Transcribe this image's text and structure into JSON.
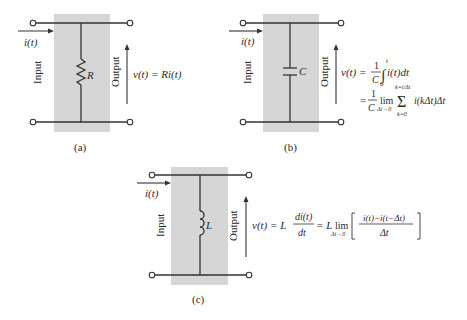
{
  "panels": [
    {
      "id": "a",
      "caption": "(a)",
      "element": "resistor",
      "element_label": "R",
      "current_label": "i(t)",
      "input_label": "Input",
      "output_label": "Output",
      "equation": {
        "lhs": "v(t) = Ri(t)"
      }
    },
    {
      "id": "b",
      "caption": "(b)",
      "element": "capacitor",
      "element_label": "C",
      "current_label": "i(t)",
      "input_label": "Input",
      "output_label": "Output",
      "equation": {
        "line1_lhs": "v(t) =",
        "line1_frac_num": "1",
        "line1_frac_den": "C",
        "line1_int_upper": "t",
        "line1_int_lower": "0",
        "line1_integrand": "i(t)dt",
        "line2_eq": "=",
        "line2_frac_num": "1",
        "line2_frac_den": "C",
        "line2_lim": "lim",
        "line2_lim_sub": "Δt→0",
        "line2_sum_upper": "k=t/Δt",
        "line2_sum_lower": "k=0",
        "line2_sum_symbol": "Σ",
        "line2_summand": "i(kΔt)Δt"
      }
    },
    {
      "id": "c",
      "caption": "(c)",
      "element": "inductor",
      "element_label": "L",
      "current_label": "i(t)",
      "input_label": "Input",
      "output_label": "Output",
      "equation": {
        "lhs": "v(t) = L",
        "frac1_num": "di(t)",
        "frac1_den": "dt",
        "mid": "= L",
        "lim": "lim",
        "lim_sub": "Δt→0",
        "frac2_num": "i(t)−i(t−Δt)",
        "frac2_den": "Δt"
      }
    }
  ],
  "colors": {
    "box_fill": "#d6d6d6",
    "wire": "#333333",
    "text": "#2a2a2a",
    "background": "#ffffff"
  }
}
